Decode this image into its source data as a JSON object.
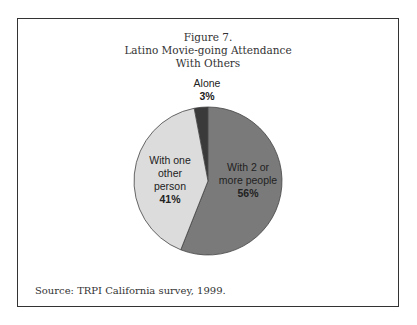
{
  "figure": {
    "label": "Figure 7.",
    "title_line1": "Latino Movie-going Attendance",
    "title_line2": "With Others",
    "source": "Source: TRPI California survey, 1999."
  },
  "chart_data": {
    "type": "pie",
    "title": "Figure 7. Latino Movie-going Attendance With Others",
    "categories": [
      "Alone",
      "With 2 or more people",
      "With one other person"
    ],
    "values": [
      3,
      56,
      41
    ],
    "colors": [
      "#3a3a3a",
      "#7a7a7a",
      "#dcdcdc"
    ],
    "labels": {
      "alone": {
        "name": "Alone",
        "pct": "3%"
      },
      "two_plus": {
        "line1": "With 2 or",
        "line2": "more people",
        "pct": "56%"
      },
      "one_other": {
        "line1": "With one",
        "line2": "other",
        "line3": "person",
        "pct": "41%"
      }
    },
    "legend": "none",
    "source": "Source: TRPI California survey, 1999."
  }
}
